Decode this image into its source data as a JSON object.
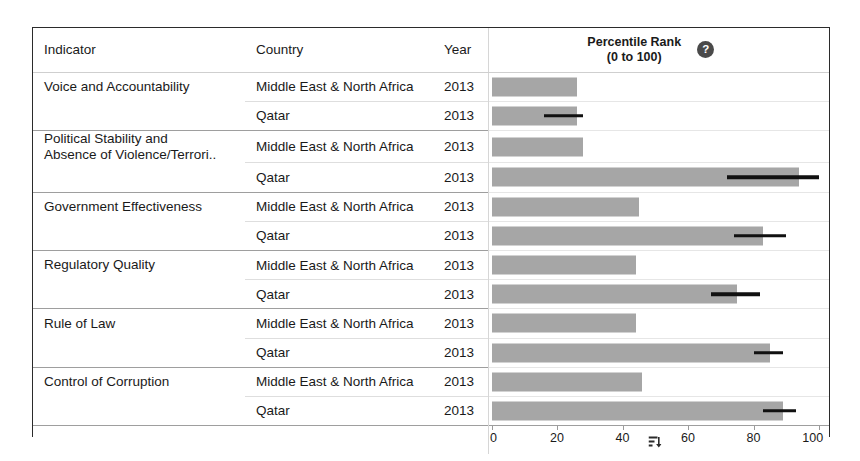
{
  "table": {
    "columns": [
      {
        "key": "indicator",
        "label": "Indicator"
      },
      {
        "key": "country",
        "label": "Country"
      },
      {
        "key": "year",
        "label": "Year"
      }
    ],
    "plot_header": {
      "line1": "Percentile Rank",
      "line2": "(0 to 100)",
      "help_glyph": "?",
      "help_name": "help-icon"
    }
  },
  "rows": [
    {
      "indicator_line1": "Voice and Accountability",
      "indicator_line2": "",
      "country": "Middle East & North Africa",
      "year": "2013",
      "value": 26,
      "err_low": null,
      "err_high": null,
      "group_start": true
    },
    {
      "indicator_line1": "",
      "indicator_line2": "",
      "country": "Qatar",
      "year": "2013",
      "value": 26,
      "err_low": 16,
      "err_high": 28,
      "group_start": false
    },
    {
      "indicator_line1": "Political Stability and",
      "indicator_line2": "Absence of Violence/Terrori..",
      "country": "Middle East & North Africa",
      "year": "2013",
      "value": 28,
      "err_low": null,
      "err_high": null,
      "group_start": true
    },
    {
      "indicator_line1": "",
      "indicator_line2": "",
      "country": "Qatar",
      "year": "2013",
      "value": 94,
      "err_low": 72,
      "err_high": 100,
      "group_start": false
    },
    {
      "indicator_line1": "Government Effectiveness",
      "indicator_line2": "",
      "country": "Middle East & North Africa",
      "year": "2013",
      "value": 45,
      "err_low": null,
      "err_high": null,
      "group_start": true
    },
    {
      "indicator_line1": "",
      "indicator_line2": "",
      "country": "Qatar",
      "year": "2013",
      "value": 83,
      "err_low": 74,
      "err_high": 90,
      "group_start": false
    },
    {
      "indicator_line1": "Regulatory Quality",
      "indicator_line2": "",
      "country": "Middle East & North Africa",
      "year": "2013",
      "value": 44,
      "err_low": null,
      "err_high": null,
      "group_start": true
    },
    {
      "indicator_line1": "",
      "indicator_line2": "",
      "country": "Qatar",
      "year": "2013",
      "value": 75,
      "err_low": 67,
      "err_high": 82,
      "group_start": false
    },
    {
      "indicator_line1": "Rule of Law",
      "indicator_line2": "",
      "country": "Middle East & North Africa",
      "year": "2013",
      "value": 44,
      "err_low": null,
      "err_high": null,
      "group_start": true
    },
    {
      "indicator_line1": "",
      "indicator_line2": "",
      "country": "Qatar",
      "year": "2013",
      "value": 85,
      "err_low": 80,
      "err_high": 89,
      "group_start": false
    },
    {
      "indicator_line1": "Control of Corruption",
      "indicator_line2": "",
      "country": "Middle East & North Africa",
      "year": "2013",
      "value": 46,
      "err_low": null,
      "err_high": null,
      "group_start": true
    },
    {
      "indicator_line1": "",
      "indicator_line2": "",
      "country": "Qatar",
      "year": "2013",
      "value": 89,
      "err_low": 83,
      "err_high": 93,
      "group_start": false
    }
  ],
  "axis": {
    "ticks": [
      "0",
      "20",
      "40",
      "60",
      "80",
      "100"
    ],
    "min": 0,
    "max": 100,
    "sort_icon_value": 50,
    "sort_icon_name": "sort-bars-icon"
  },
  "colors": {
    "bar": "#a6a6a6",
    "error_bar": "#111111",
    "frame": "#2b2b2b",
    "text": "#1a1a1a",
    "rule_major": "#9e9e9e",
    "rule_minor": "#dedede"
  },
  "chart_data": {
    "type": "bar",
    "title": "Percentile Rank (0 to 100)",
    "xlabel": "Percentile Rank (0 to 100)",
    "ylabel": "",
    "xlim": [
      0,
      100
    ],
    "grid": false,
    "legend_position": "none",
    "orientation": "horizontal",
    "year": "2013",
    "categories": [
      "Voice and Accountability",
      "Political Stability and Absence of Violence/Terrori..",
      "Government Effectiveness",
      "Regulatory Quality",
      "Rule of Law",
      "Control of Corruption"
    ],
    "series": [
      {
        "name": "Middle East & North Africa",
        "values": [
          26,
          28,
          45,
          44,
          44,
          46
        ]
      },
      {
        "name": "Qatar",
        "values": [
          26,
          94,
          83,
          75,
          85,
          89
        ]
      }
    ],
    "error_bars": {
      "series": "Qatar",
      "low": [
        16,
        72,
        74,
        67,
        80,
        83
      ],
      "high": [
        28,
        100,
        90,
        82,
        89,
        93
      ]
    },
    "xticks": [
      0,
      20,
      40,
      60,
      80,
      100
    ]
  }
}
